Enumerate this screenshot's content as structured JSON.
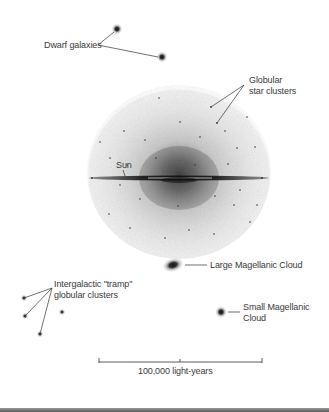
{
  "diagram": {
    "labels": {
      "dwarf_galaxies": "Dwarf galaxies",
      "globular_line1": "Globular",
      "globular_line2": "star clusters",
      "sun": "Sun",
      "lmc": "Large Magellanic Cloud",
      "smc_line1": "Small Magellanic",
      "smc_line2": "Cloud",
      "tramp_line1": "Intergalactic \"tramp\"",
      "tramp_line2": "globular clusters"
    },
    "scale_bar": {
      "label": "100,000 light-years"
    },
    "colors": {
      "background": "#ffffff",
      "ink": "#3a3a3a",
      "halo": "#8a8a8a",
      "core": "#1e1e1e"
    },
    "objects": {
      "dwarf_galaxies": [
        {
          "x": 117,
          "y": 29
        },
        {
          "x": 162,
          "y": 57
        }
      ],
      "halo": {
        "cx": 179,
        "cy": 172,
        "rx": 92,
        "ry": 87
      },
      "lmc": {
        "x": 173,
        "y": 265
      },
      "smc": {
        "x": 221,
        "y": 312
      },
      "tramp_clusters": [
        {
          "x": 24,
          "y": 298
        },
        {
          "x": 25,
          "y": 316
        },
        {
          "x": 40,
          "y": 334
        },
        {
          "x": 62,
          "y": 312
        }
      ]
    }
  }
}
